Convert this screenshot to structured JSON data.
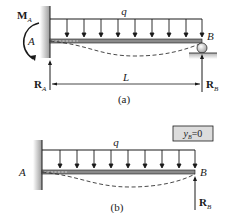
{
  "figure_a": {
    "caption": "(a)",
    "load_label": "q",
    "moment_label": "M",
    "moment_sub": "A",
    "point_a": "A",
    "point_b": "B",
    "reaction_a_label": "R",
    "reaction_a_sub": "A",
    "reaction_b_label": "R",
    "reaction_b_sub": "B",
    "span_label": "L",
    "load_arrow_count": 9
  },
  "figure_b": {
    "caption": "(b)",
    "load_label": "q",
    "point_a": "A",
    "point_b": "B",
    "reaction_b_label": "R",
    "reaction_b_sub": "B",
    "condition_var": "y",
    "condition_sub": "B",
    "condition_rest": "=0",
    "load_arrow_count": 9
  },
  "colors": {
    "line": "#1a1a1a",
    "wall_fill": "#b8b8b8",
    "beam_fill": "#8a8a8a",
    "box_fill": "#dcdcdc",
    "ground": "#c8c8c8"
  }
}
